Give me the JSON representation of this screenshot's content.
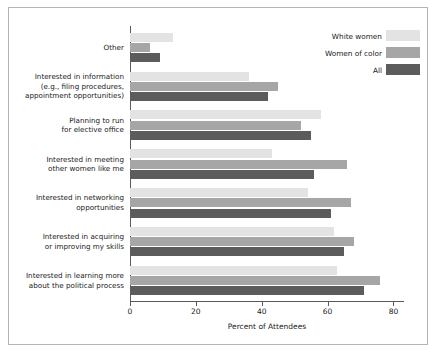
{
  "chart_data": {
    "type": "bar",
    "orientation": "horizontal",
    "title": "",
    "xlabel": "Percent of Attendees",
    "ylabel": "",
    "xlim": [
      0,
      82
    ],
    "xticks": [
      0,
      20,
      40,
      60,
      80
    ],
    "xtick_labels": [
      "0",
      "20",
      "40",
      "60",
      "80"
    ],
    "grid": false,
    "legend_position": "top-right",
    "categories": [
      "Other",
      "Interested in information\n(e.g., filing procedures,\nappointment opportunities)",
      "Planning to run\nfor elective office",
      "Interested in meeting\nother women like me",
      "Interested in networking\nopportunities",
      "Interested in acquiring\nor improving my skills",
      "Interested in learning more\nabout the political process"
    ],
    "series": [
      {
        "name": "White women",
        "color": "#e3e3e3",
        "values": [
          13,
          36,
          58,
          43,
          54,
          62,
          63
        ]
      },
      {
        "name": "Women of color",
        "color": "#a6a6a6",
        "values": [
          6,
          45,
          52,
          66,
          67,
          68,
          76
        ]
      },
      {
        "name": "All",
        "color": "#5c5c5c",
        "values": [
          9,
          42,
          55,
          56,
          61,
          65,
          71
        ]
      }
    ]
  },
  "legend": {
    "items": [
      {
        "label": "White women"
      },
      {
        "label": "Women of color"
      },
      {
        "label": "All"
      }
    ]
  },
  "axis": {
    "x_title": "Percent of Attendees"
  }
}
